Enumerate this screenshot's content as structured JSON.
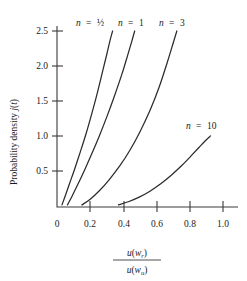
{
  "chart_data": {
    "type": "line",
    "title": "",
    "xlabel": "u(w_r) / u(w_u)",
    "ylabel": "Probability density j(t)",
    "xlim": [
      0,
      1.1
    ],
    "ylim": [
      0,
      2.68
    ],
    "grid": false,
    "legend_position": "inline-curve-labels",
    "xticks": [
      "0",
      "0.2",
      "0.4",
      "0.6",
      "0.8",
      "1.0"
    ],
    "xtick_values": [
      0,
      0.2,
      0.4,
      0.6,
      0.8,
      1.0
    ],
    "yticks": [
      "0.5",
      "1.0",
      "1.5",
      "2.0",
      "2.5"
    ],
    "ytick_values": [
      0.5,
      1.0,
      1.5,
      2.0,
      2.5
    ],
    "series": [
      {
        "name": "n = 1/2",
        "label_n": "n",
        "label_eq": "=",
        "label_value": "½",
        "x": [
          0.03,
          0.05,
          0.075,
          0.105,
          0.14,
          0.175,
          0.21,
          0.245,
          0.275,
          0.3,
          0.32,
          0.335
        ],
        "y": [
          0.03,
          0.16,
          0.33,
          0.53,
          0.78,
          1.04,
          1.33,
          1.64,
          1.93,
          2.17,
          2.37,
          2.5
        ]
      },
      {
        "name": "n = 1",
        "label_n": "n",
        "label_eq": "=",
        "label_value": "1",
        "x": [
          0.063,
          0.09,
          0.125,
          0.165,
          0.21,
          0.255,
          0.3,
          0.345,
          0.39,
          0.425,
          0.45,
          0.468
        ],
        "y": [
          0.03,
          0.15,
          0.32,
          0.52,
          0.76,
          1.01,
          1.28,
          1.57,
          1.88,
          2.15,
          2.35,
          2.5
        ]
      },
      {
        "name": "n = 3",
        "label_n": "n",
        "label_eq": "=",
        "label_value": "3",
        "x": [
          0.15,
          0.2,
          0.255,
          0.315,
          0.38,
          0.44,
          0.5,
          0.56,
          0.615,
          0.665,
          0.7,
          0.722
        ],
        "y": [
          0.03,
          0.11,
          0.23,
          0.39,
          0.59,
          0.81,
          1.07,
          1.37,
          1.7,
          2.06,
          2.33,
          2.5
        ]
      },
      {
        "name": "n = 10",
        "label_n": "n",
        "label_eq": "=",
        "label_value": "10",
        "x": [
          0.37,
          0.43,
          0.495,
          0.56,
          0.625,
          0.69,
          0.75,
          0.805,
          0.855,
          0.895,
          0.925
        ],
        "y": [
          0.03,
          0.075,
          0.14,
          0.225,
          0.33,
          0.455,
          0.585,
          0.72,
          0.845,
          0.945,
          1.01
        ]
      }
    ],
    "axis_title_numerator": "u(w",
    "axis_title_num_sub": "r",
    "axis_title_denominator": "u(w",
    "axis_title_den_sub": "u"
  },
  "axes": {
    "ylabel_prefix": "Probability density ",
    "ylabel_italic_j": "j",
    "ylabel_paren_open": "(",
    "ylabel_italic_t": "t",
    "ylabel_paren_close": ")"
  },
  "xaxis_title": {
    "num_u": "u",
    "num_open": "(",
    "num_w": "w",
    "num_sub": "r",
    "num_close": ")",
    "den_u": "u",
    "den_open": "(",
    "den_w": "w",
    "den_sub": "u",
    "den_close": ")"
  }
}
